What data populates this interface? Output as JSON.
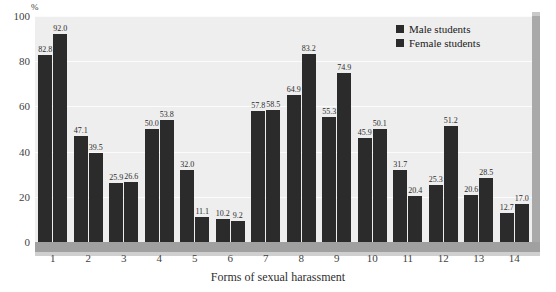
{
  "chart_data": {
    "type": "bar",
    "title": "",
    "xlabel": "Forms of sexual harassment",
    "ylabel": "%",
    "ylim": [
      0,
      100
    ],
    "yticks": [
      0,
      20,
      40,
      60,
      80,
      100
    ],
    "grid": true,
    "legend_position": "top-right",
    "categories": [
      "1",
      "2",
      "3",
      "4",
      "5",
      "6",
      "7",
      "8",
      "9",
      "10",
      "11",
      "12",
      "13",
      "14"
    ],
    "series": [
      {
        "name": "Male students",
        "values": [
          82.8,
          47.1,
          25.9,
          50.0,
          32.0,
          10.2,
          57.8,
          64.9,
          55.3,
          45.9,
          31.7,
          25.3,
          20.6,
          12.7
        ]
      },
      {
        "name": "Female students",
        "values": [
          92.0,
          39.5,
          26.6,
          53.8,
          11.1,
          9.2,
          58.5,
          83.2,
          74.9,
          50.1,
          20.4,
          51.2,
          28.5,
          17.0
        ]
      }
    ],
    "colors": {
      "male": "#2b2b2b",
      "female": "#2b2b2b",
      "plot_background": "#eeeeee",
      "floor": "#a0a0a0",
      "wall": "#a9a9a9"
    }
  }
}
